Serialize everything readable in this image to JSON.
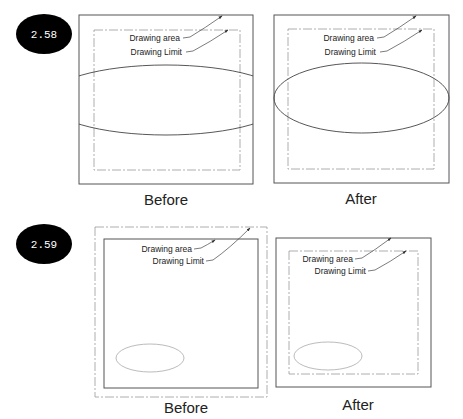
{
  "figures": [
    {
      "id_label": "2.58",
      "panels": [
        {
          "caption": "Before",
          "label_area": "Drawing area",
          "label_limit": "Drawing Limit"
        },
        {
          "caption": "After",
          "label_area": "Drawing area",
          "label_limit": "Drawing Limit"
        }
      ]
    },
    {
      "id_label": "2.59",
      "panels": [
        {
          "caption": "Before",
          "label_area": "Drawing area",
          "label_limit": "Drawing Limit"
        },
        {
          "caption": "After",
          "label_area": "Drawing area",
          "label_limit": "Drawing Limit"
        }
      ]
    }
  ],
  "colors": {
    "line": "#555555",
    "dash": "#888888",
    "badge": "#000000"
  }
}
